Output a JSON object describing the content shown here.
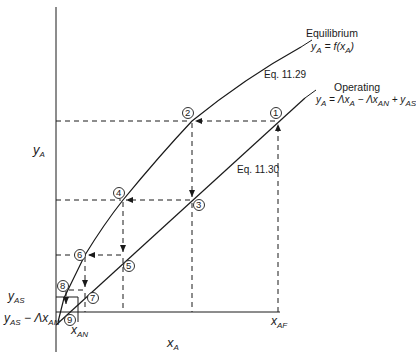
{
  "diagram": {
    "axes": {
      "y_label": "y",
      "y_label_sub": "A",
      "x_label": "x",
      "x_label_sub": "A"
    },
    "curves": {
      "equilibrium": {
        "name": "Equilibrium",
        "equation_lhs": "y",
        "equation_lhs_sub": "A",
        "equation_rhs": " = f(x",
        "equation_rhs_sub": "A",
        "equation_close": ")",
        "ref": "Eq. 11.29"
      },
      "operating": {
        "name": "Operating",
        "equation": "y_A = Λx_A − Λx_AN + y_AS",
        "ref": "Eq. 11.30"
      }
    },
    "axis_ticks": {
      "y_AS": {
        "base": "y",
        "sub": "AS"
      },
      "intercept": {
        "base": "y",
        "sub": "AS",
        "rest": " − Λx",
        "rest_sub": "AN"
      },
      "x_AN": {
        "base": "x",
        "sub": "AN"
      },
      "x_AF": {
        "base": "x",
        "sub": "AF"
      }
    },
    "points": [
      "1",
      "2",
      "3",
      "4",
      "5",
      "6",
      "7",
      "8",
      "9"
    ],
    "colors": {
      "line": "#1a1a1a",
      "background": "#ffffff"
    }
  }
}
